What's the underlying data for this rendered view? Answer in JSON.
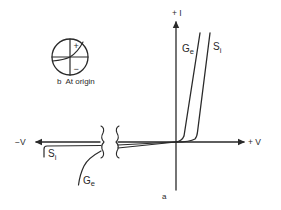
{
  "figure": {
    "type": "diode I-V characteristic diagram",
    "axes": {
      "y_axis_label": "+ I",
      "x_axis_positive_label": "+ V",
      "x_axis_negative_label": "−V"
    },
    "curves": [
      {
        "name": "germanium",
        "label_main": "G",
        "label_sub": "e"
      },
      {
        "name": "silicon",
        "label_main": "S",
        "label_sub": "i"
      }
    ],
    "reverse_curves": [
      {
        "name": "silicon-reverse",
        "label_main": "S",
        "label_sub": "i"
      },
      {
        "name": "germanium-reverse",
        "label_main": "G",
        "label_sub": "e"
      }
    ],
    "inset": {
      "plus_sign": "+",
      "minus_sign": "−",
      "caption": "b  At origin"
    },
    "panel_label": "a",
    "colors": {
      "ink": "#2a2a2a",
      "background": "#ffffff"
    }
  }
}
